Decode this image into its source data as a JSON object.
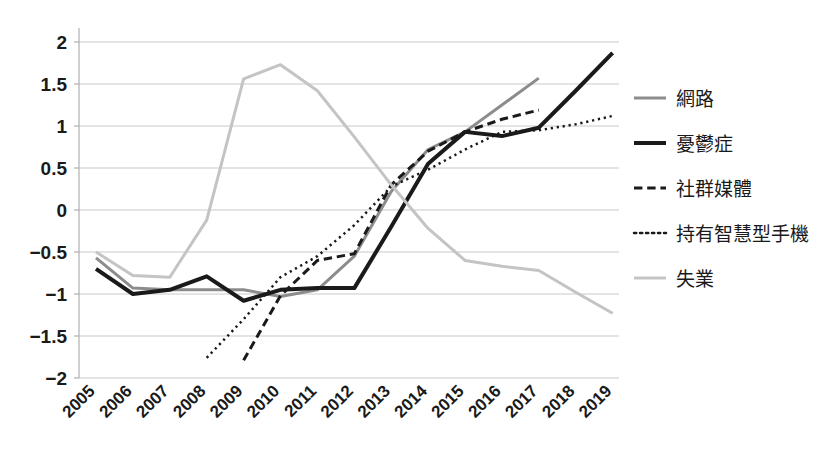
{
  "chart_data": {
    "type": "line",
    "title": "",
    "xlabel": "",
    "ylabel": "",
    "grid": true,
    "legend_position": "right",
    "x": [
      "2005",
      "2006",
      "2007",
      "2008",
      "2009",
      "2010",
      "2011",
      "2012",
      "2013",
      "2014",
      "2015",
      "2016",
      "2017",
      "2018",
      "2019"
    ],
    "ylim": [
      -2,
      2
    ],
    "yticks": [
      "2",
      "1.5",
      "1",
      "0.5",
      "0",
      "-0.5",
      "-1",
      "-1.5",
      "-2"
    ],
    "ytick_values": [
      2,
      1.5,
      1,
      0.5,
      0,
      -0.5,
      -1,
      -1.5,
      -2
    ],
    "series": [
      {
        "name": "網路",
        "color": "#8c8c8c",
        "style": "solid",
        "width": 3,
        "x": [
          "2005",
          "2006",
          "2007",
          "2008",
          "2009",
          "2010",
          "2011",
          "2012",
          "2013",
          "2014",
          "2015",
          "2016",
          "2017"
        ],
        "values": [
          -0.57,
          -0.93,
          -0.95,
          -0.95,
          -0.95,
          -1.03,
          -0.95,
          -0.55,
          0.22,
          0.72,
          0.93,
          1.25,
          1.57
        ]
      },
      {
        "name": "憂鬱症",
        "color": "#1a1a1a",
        "style": "solid",
        "width": 4,
        "x": [
          "2005",
          "2006",
          "2007",
          "2008",
          "2009",
          "2010",
          "2011",
          "2012",
          "2013",
          "2014",
          "2015",
          "2016",
          "2017",
          "2018",
          "2019"
        ],
        "values": [
          -0.7,
          -1.0,
          -0.95,
          -0.79,
          -1.08,
          -0.95,
          -0.93,
          -0.93,
          -0.2,
          0.55,
          0.93,
          0.88,
          0.98,
          1.42,
          1.87
        ]
      },
      {
        "name": "社群媒體",
        "color": "#1a1a1a",
        "style": "dashed",
        "width": 3,
        "x": [
          "2009",
          "2010",
          "2011",
          "2012",
          "2013",
          "2014",
          "2015",
          "2016",
          "2017"
        ],
        "values": [
          -1.79,
          -1.02,
          -0.6,
          -0.52,
          0.3,
          0.7,
          0.93,
          1.08,
          1.19
        ]
      },
      {
        "name": "持有智慧型手機",
        "color": "#1a1a1a",
        "style": "dotted",
        "width": 2.5,
        "x": [
          "2008",
          "2009",
          "2010",
          "2011",
          "2012",
          "2013",
          "2014",
          "2015",
          "2016",
          "2017",
          "2018",
          "2019"
        ],
        "values": [
          -1.76,
          -1.3,
          -0.8,
          -0.55,
          -0.18,
          0.28,
          0.48,
          0.72,
          0.93,
          0.95,
          1.02,
          1.12
        ]
      },
      {
        "name": "失業",
        "color": "#c4c4c4",
        "style": "solid",
        "width": 3,
        "x": [
          "2005",
          "2006",
          "2007",
          "2008",
          "2009",
          "2010",
          "2011",
          "2012",
          "2013",
          "2014",
          "2015",
          "2016",
          "2017",
          "2018",
          "2019"
        ],
        "values": [
          -0.5,
          -0.78,
          -0.8,
          -0.12,
          1.56,
          1.73,
          1.42,
          0.87,
          0.3,
          -0.22,
          -0.6,
          -0.67,
          -0.72,
          -0.98,
          -1.23
        ]
      }
    ]
  },
  "legend": {
    "items": [
      {
        "label": "網路",
        "color": "#8c8c8c",
        "style": "solid",
        "width": 3
      },
      {
        "label": "憂鬱症",
        "color": "#1a1a1a",
        "style": "solid",
        "width": 4
      },
      {
        "label": "社群媒體",
        "color": "#1a1a1a",
        "style": "dashed",
        "width": 3
      },
      {
        "label": "持有智慧型手機",
        "color": "#1a1a1a",
        "style": "dotted",
        "width": 2.5
      },
      {
        "label": "失業",
        "color": "#c4c4c4",
        "style": "solid",
        "width": 3
      }
    ]
  }
}
